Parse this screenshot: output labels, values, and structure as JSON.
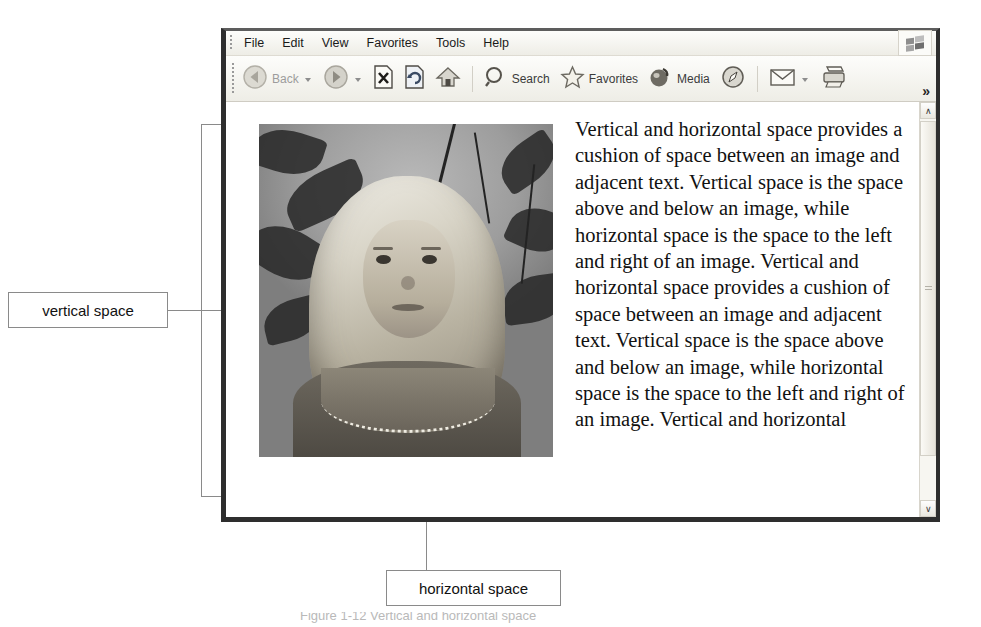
{
  "browser": {
    "menu": {
      "items": [
        "File",
        "Edit",
        "View",
        "Favorites",
        "Tools",
        "Help"
      ],
      "brand_icon": "windows-flag-icon"
    },
    "toolbar": {
      "back_label": "Back",
      "back_icon": "back-arrow-icon",
      "forward_icon": "forward-arrow-icon",
      "stop_icon": "stop-icon",
      "refresh_icon": "refresh-icon",
      "home_icon": "home-icon",
      "search_label": "Search",
      "search_icon": "magnifier-icon",
      "favorites_label": "Favorites",
      "favorites_icon": "star-icon",
      "media_label": "Media",
      "media_icon": "media-globe-icon",
      "history_icon": "history-compass-icon",
      "mail_icon": "mail-envelope-icon",
      "print_icon": "printer-icon",
      "overflow_label": "»"
    },
    "scrollbar": {
      "up_arrow": "∧",
      "down_arrow": "∨"
    }
  },
  "page": {
    "image_alt": "grayscale photo of a young girl with long light hair standing among foliage",
    "paragraph": "Vertical and horizontal space provides a cushion of space between an image and adjacent text. Vertical space is the space above and below an image, while horizontal space is the space to the left and right of an image. Vertical and horizontal space provides a cushion of space between an image and adjacent text. Vertical space is the space above and below an image, while horizontal space is the space to the left and right of an image. Vertical and horizontal"
  },
  "annotations": {
    "vertical_space_label": "vertical space",
    "horizontal_space_label": "horizontal space"
  },
  "caption": {
    "text": "Figure 1-12 Vertical and horizontal space"
  },
  "colors": {
    "annotation_line": "#8a8a8a",
    "window_border": "#2e2e2e",
    "toolbar_bg": "#f2f1eb",
    "page_bg": "#ffffff"
  }
}
